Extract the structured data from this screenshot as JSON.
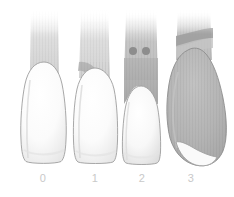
{
  "figure": {
    "background_color": "#ffffff",
    "width": 234,
    "height": 197,
    "outline_color": "#9a9a9a",
    "label_color": "#c9c9c9",
    "enamel_color": "#fcfcfc",
    "root_color": "#efefef",
    "bone_color": "#b9b9b9",
    "lesion_color": "#8f8f8f"
  },
  "specimens": [
    {
      "id": "grade-0",
      "label": "0",
      "label_x": 38,
      "label_y": 178,
      "description": "Intact root trunk with no bone loss; crown fully enamel-white, root shaft pale grey and fading toward apex.",
      "crown_color": "#fdfdfd",
      "root_color": "#e8e8e8",
      "bone_color": "#dedede",
      "lesion_present": false,
      "dot_count": 0,
      "crown_left": 20,
      "crown_right": 66,
      "crown_bottom": 163,
      "root_left": 31,
      "root_right": 58,
      "root_top": 14
    },
    {
      "id": "grade-1",
      "label": "1",
      "label_x": 90,
      "label_y": 178,
      "description": "Early horizontal bone loss; a darker grey collar wraps the cervical region above the crown.",
      "crown_color": "#fcfcfc",
      "root_color": "#e6e6e6",
      "bone_color": "#b5b5b5",
      "lesion_present": true,
      "dot_count": 0,
      "crown_left": 72,
      "crown_right": 116,
      "crown_bottom": 163,
      "root_left": 81,
      "root_right": 108,
      "root_top": 15
    },
    {
      "id": "grade-2",
      "label": "2",
      "label_x": 137,
      "label_y": 178,
      "description": "Partial furcation involvement; grey lesion extends further apically and two dark round perforations appear on the root shaft.",
      "crown_color": "#fbfbfb",
      "root_color": "#e4e4e4",
      "bone_color": "#a8a8a8",
      "lesion_present": true,
      "dot_count": 2,
      "dots": [
        {
          "cx": 133,
          "cy": 51,
          "r": 4
        },
        {
          "cx": 146,
          "cy": 51,
          "r": 4
        }
      ],
      "crown_left": 120,
      "crown_right": 162,
      "crown_bottom": 163,
      "root_left": 126,
      "root_right": 156,
      "root_top": 14
    },
    {
      "id": "grade-3",
      "label": "3",
      "label_x": 186,
      "label_y": 178,
      "description": "Through-and-through furcation; a large bulbous grey lesion envelops nearly the entire root leaving only a small white apical tip.",
      "crown_color": "#f6f6f6",
      "root_color": "#b0b0b0",
      "bone_color": "#a0a0a0",
      "lesion_present": true,
      "dot_count": 0,
      "crown_left": 166,
      "crown_right": 226,
      "crown_bottom": 166,
      "root_left": 178,
      "root_right": 210,
      "root_top": 14
    }
  ],
  "labels": {
    "grade_0": "0",
    "grade_1": "1",
    "grade_2": "2",
    "grade_3": "3"
  }
}
